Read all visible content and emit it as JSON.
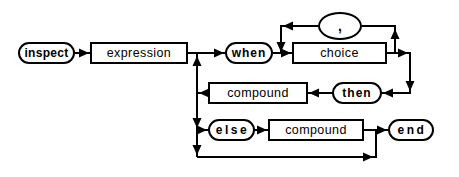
{
  "diagram": {
    "name": "inspect instruction syntax diagram",
    "background_color": "#ffffff",
    "line_color": "#000000",
    "nodes": {
      "inspect": {
        "label": "inspect",
        "type": "terminal"
      },
      "expression": {
        "label": "expression",
        "type": "nonterminal"
      },
      "when": {
        "label": "when",
        "type": "terminal"
      },
      "comma": {
        "label": ",",
        "type": "terminal"
      },
      "choice": {
        "label": "choice",
        "type": "nonterminal"
      },
      "compound_then": {
        "label": "compound",
        "type": "nonterminal"
      },
      "then": {
        "label": "then",
        "type": "terminal"
      },
      "else": {
        "label": "else",
        "type": "terminal"
      },
      "compound_else": {
        "label": "compound",
        "type": "nonterminal"
      },
      "end": {
        "label": "end",
        "type": "terminal"
      }
    }
  }
}
